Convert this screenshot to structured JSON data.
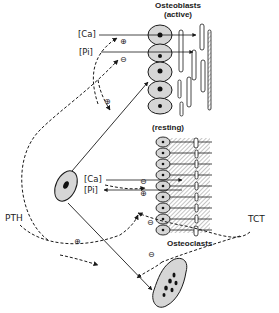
{
  "labels": {
    "osteoblasts_active": "Osteoblasts",
    "osteoblasts_active_sub": "(active)",
    "resting": "(resting)",
    "osteoclasts": "Osteoclasts",
    "pth": "PTH",
    "tct": "TCT",
    "ca_top": "[Ca]",
    "pi_top": "[Pi]",
    "ca_mid": "[Ca]",
    "pi_mid": "[Pi]"
  },
  "signs": {
    "plus_top": "⊕",
    "minus_top": "⊖",
    "plus_loop": "⊕",
    "minus_mid": "⊖",
    "plus_mid": "⊕",
    "minus_tct_upper": "⊖",
    "minus_tct_lower": "⊖",
    "plus_pth_lower": "⊕"
  },
  "colors": {
    "ink": "#1a1a1a",
    "cell_fill": "#d6d6d6",
    "nucleus": "#111111",
    "hatch": "#8a8a8a",
    "background": "#ffffff"
  }
}
